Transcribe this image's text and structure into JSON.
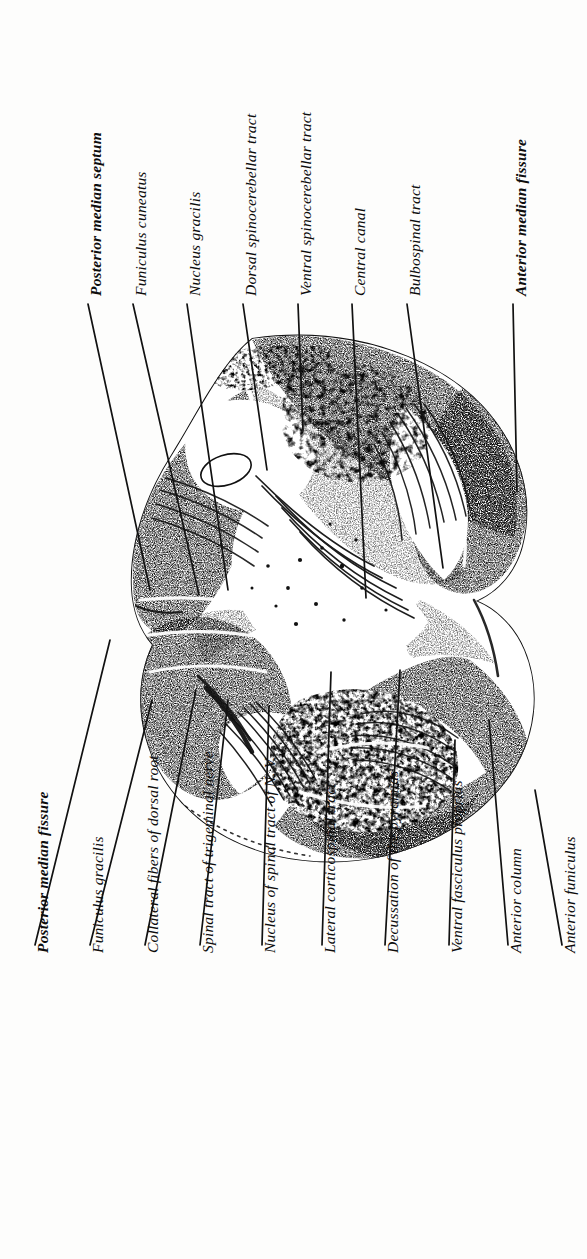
{
  "figure": {
    "orientation": "rotated-90",
    "ink_color": "#111111",
    "paper_color": "#fdfdfc"
  },
  "labels_top": [
    {
      "text": "Posterior median septum",
      "bold": true,
      "x": 88,
      "y": 296,
      "lead_x1": 88,
      "lead_y1": 304,
      "lead_x2": 150,
      "lead_y2": 590
    },
    {
      "text": "Funiculus cuneatus",
      "bold": false,
      "x": 133,
      "y": 296,
      "lead_x1": 133,
      "lead_y1": 304,
      "lead_x2": 199,
      "lead_y2": 595
    },
    {
      "text": "Nucleus gracilis",
      "bold": false,
      "x": 187,
      "y": 296,
      "lead_x1": 187,
      "lead_y1": 304,
      "lead_x2": 228,
      "lead_y2": 590
    },
    {
      "text": "Dorsal spinocerebellar tract",
      "bold": false,
      "x": 243,
      "y": 296,
      "lead_x1": 243,
      "lead_y1": 304,
      "lead_x2": 267,
      "lead_y2": 470
    },
    {
      "text": "Ventral spinocerebellar tract",
      "bold": false,
      "x": 298,
      "y": 296,
      "lead_x1": 298,
      "lead_y1": 304,
      "lead_x2": 303,
      "lead_y2": 430
    },
    {
      "text": "Central canal",
      "bold": false,
      "x": 352,
      "y": 296,
      "lead_x1": 352,
      "lead_y1": 304,
      "lead_x2": 366,
      "lead_y2": 598
    },
    {
      "text": "Bulbospinal tract",
      "bold": false,
      "x": 407,
      "y": 296,
      "lead_x1": 407,
      "lead_y1": 304,
      "lead_x2": 443,
      "lead_y2": 568
    },
    {
      "text": "Anterior median fissure",
      "bold": true,
      "x": 513,
      "y": 296,
      "lead_x1": 513,
      "lead_y1": 304,
      "lead_x2": 517,
      "lead_y2": 492
    }
  ],
  "labels_bottom": [
    {
      "text": "Posterior median fissure",
      "bold": true,
      "x": 35,
      "y": 953,
      "lead_x1": 35,
      "lead_y1": 945,
      "lead_x2": 110,
      "lead_y2": 640
    },
    {
      "text": "Funiculus gracilis",
      "bold": false,
      "x": 90,
      "y": 953,
      "lead_x1": 90,
      "lead_y1": 945,
      "lead_x2": 152,
      "lead_y2": 700
    },
    {
      "text": "Collateral fibers of dorsal root",
      "bold": false,
      "x": 145,
      "y": 953,
      "lead_x1": 145,
      "lead_y1": 945,
      "lead_x2": 196,
      "lead_y2": 690
    },
    {
      "text": "Spinal tract of trigeminal nerve",
      "bold": false,
      "x": 200,
      "y": 953,
      "lead_x1": 200,
      "lead_y1": 945,
      "lead_x2": 228,
      "lead_y2": 700
    },
    {
      "text": "Nucleus of spinal tract of N. V.",
      "bold": false,
      "x": 262,
      "y": 953,
      "lead_x1": 262,
      "lead_y1": 945,
      "lead_x2": 269,
      "lead_y2": 706
    },
    {
      "text": "Lateral corticospinal tract",
      "bold": false,
      "x": 322,
      "y": 953,
      "lead_x1": 322,
      "lead_y1": 945,
      "lead_x2": 331,
      "lead_y2": 672
    },
    {
      "text": "Decussation of the pyramids",
      "bold": false,
      "x": 385,
      "y": 953,
      "lead_x1": 385,
      "lead_y1": 945,
      "lead_x2": 400,
      "lead_y2": 670
    },
    {
      "text": "Ventral fasciculus proprius",
      "bold": false,
      "x": 449,
      "y": 953,
      "lead_x1": 449,
      "lead_y1": 945,
      "lead_x2": 455,
      "lead_y2": 740
    },
    {
      "text": "Anterior column",
      "bold": false,
      "x": 508,
      "y": 953,
      "lead_x1": 508,
      "lead_y1": 945,
      "lead_x2": 489,
      "lead_y2": 720
    },
    {
      "text": "Anterior funiculus",
      "bold": false,
      "x": 562,
      "y": 953,
      "lead_x1": 562,
      "lead_y1": 945,
      "lead_x2": 535,
      "lead_y2": 790
    }
  ],
  "specimen": {
    "name": "medulla-oblongata-cross-section",
    "outline_note": "bilobed transverse section, dark stippled grey matter with pale white-matter tracts"
  }
}
